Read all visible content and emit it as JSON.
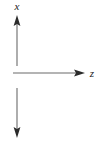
{
  "figure": {
    "name": "coordinate-axis-diagram",
    "background_color": "#ffffff",
    "stroke_color": "#6b6b6b",
    "arrowhead_color": "#2b2b2b",
    "label_color": "#1a1a1a",
    "width": 102,
    "height": 143
  },
  "labels": {
    "vertical_axis": "x",
    "horizontal_axis": "z"
  },
  "axes": [
    {
      "id": "vertical-up-arrow",
      "label": "x",
      "direction": "up",
      "x": 17,
      "y_start": 66,
      "y_end": 17,
      "arrowhead": "up"
    },
    {
      "id": "horizontal-right-arrow",
      "label": "z",
      "direction": "right",
      "y": 73,
      "x_start": 13,
      "x_end": 85,
      "arrowhead": "right"
    },
    {
      "id": "vertical-down-arrow",
      "label": "",
      "direction": "down",
      "x": 17,
      "y_start": 88,
      "y_end": 137,
      "arrowhead": "down"
    }
  ]
}
